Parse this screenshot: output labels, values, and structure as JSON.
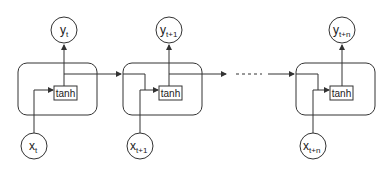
{
  "diagram": {
    "cells": [
      {
        "id": "cell-t",
        "activation": "tanh",
        "input": {
          "base": "x",
          "sub": "t"
        },
        "output": {
          "base": "y",
          "sub": "t"
        }
      },
      {
        "id": "cell-t1",
        "activation": "tanh",
        "input": {
          "base": "x",
          "sub": "t+1"
        },
        "output": {
          "base": "y",
          "sub": "t+1"
        }
      },
      {
        "id": "cell-tn",
        "activation": "tanh",
        "input": {
          "base": "x",
          "sub": "t+n"
        },
        "output": {
          "base": "y",
          "sub": "t+n"
        }
      }
    ],
    "colors": {
      "stroke": "#333333",
      "background": "#ffffff",
      "text": "#222222"
    }
  }
}
